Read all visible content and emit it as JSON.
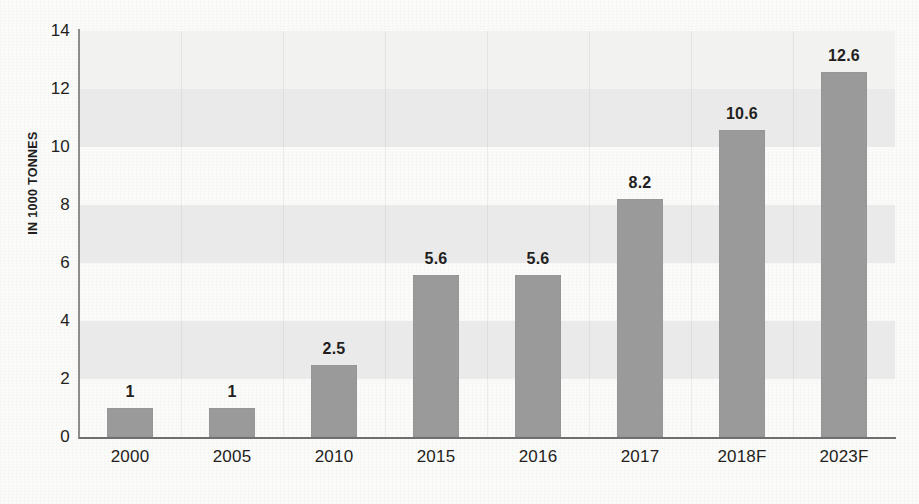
{
  "chart_data": {
    "type": "bar",
    "title": "",
    "subtitle": "",
    "xlabel": "",
    "ylabel": "IN 1000 TONNES",
    "categories": [
      "2000",
      "2005",
      "2010",
      "2015",
      "2016",
      "2017",
      "2018F",
      "2023F"
    ],
    "values": [
      1,
      1,
      2.5,
      5.6,
      5.6,
      8.2,
      10.6,
      12.6
    ],
    "value_labels": [
      "1",
      "1",
      "2.5",
      "5.6",
      "5.6",
      "8.2",
      "10.6",
      "12.6"
    ],
    "ylim": [
      0,
      14
    ],
    "ytick_values": [
      0,
      2,
      4,
      6,
      8,
      10,
      12,
      14
    ],
    "ytick_labels": [
      "0",
      "2",
      "4",
      "6",
      "8",
      "10",
      "12",
      "14"
    ],
    "grid": "horizontal-bands-and-faint-vertical-gridlines",
    "legend": "none",
    "legend_position": "none",
    "bar_color": "#9a9a9a",
    "band_color": "#eaeaea",
    "axis_color": "#6f6f6f",
    "text_color": "#231f20",
    "background_color": "#fbfbfa"
  }
}
